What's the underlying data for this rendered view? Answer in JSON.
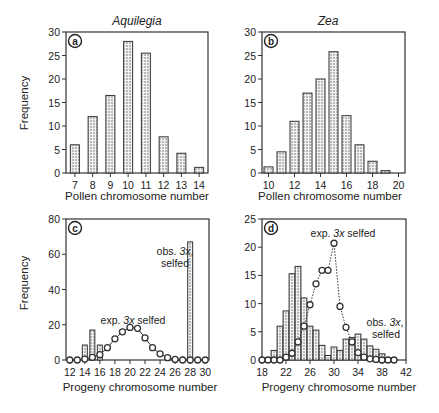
{
  "figure": {
    "ylabel": "Frequency",
    "colors": {
      "axis": "#333333",
      "bar_fill": "#d8d8d8",
      "bar_stroke": "#333333",
      "marker_fill": "#ffffff",
      "line": "#333333"
    }
  },
  "chart_data": [
    {
      "id": "a",
      "type": "bar",
      "title": "Aquilegia",
      "panel_label": "a",
      "xlabel": "Pollen chromosome number",
      "ylabel": "Frequency",
      "categories": [
        7,
        8,
        9,
        10,
        11,
        12,
        13,
        14
      ],
      "values": [
        6,
        12,
        16.5,
        28,
        25.5,
        7.7,
        4.2,
        1.2
      ],
      "xticks": [
        7,
        8,
        9,
        10,
        11,
        12,
        13,
        14
      ],
      "yticks": [
        0,
        5,
        10,
        15,
        20,
        25,
        30
      ],
      "xlim": [
        6.5,
        14.5
      ],
      "ylim": [
        0,
        30
      ],
      "grid": false
    },
    {
      "id": "b",
      "type": "bar",
      "title": "Zea",
      "panel_label": "b",
      "xlabel": "Pollen chromosome number",
      "ylabel": "",
      "categories": [
        10,
        11,
        12,
        13,
        14,
        15,
        16,
        17,
        18,
        19
      ],
      "values": [
        1.3,
        4.5,
        11,
        17,
        20,
        25.8,
        12.2,
        6,
        2.5,
        0.5
      ],
      "xticks": [
        10,
        12,
        14,
        16,
        18,
        20
      ],
      "yticks": [
        0,
        5,
        10,
        15,
        20,
        25,
        30
      ],
      "xlim": [
        9.5,
        20.5
      ],
      "ylim": [
        0,
        30
      ],
      "grid": false
    },
    {
      "id": "c",
      "type": "bar+line",
      "title": "",
      "panel_label": "c",
      "xlabel": "Progeny chromosome number",
      "ylabel": "Frequency",
      "series": [
        {
          "name": "obs. 3x, selfed",
          "type": "bar",
          "x": [
            14,
            15,
            16,
            28
          ],
          "values": [
            8.5,
            17,
            8.5,
            67
          ]
        },
        {
          "name": "exp. 3x selfed",
          "type": "line",
          "x": [
            12,
            13,
            14,
            15,
            16,
            17,
            18,
            19,
            20,
            21,
            22,
            23,
            24,
            25,
            26,
            27,
            28,
            29,
            30
          ],
          "values": [
            0,
            0,
            0.5,
            1.5,
            3,
            7,
            12,
            16,
            18.5,
            18,
            12.5,
            7,
            3.5,
            1.3,
            0.3,
            0,
            0,
            0,
            0
          ]
        }
      ],
      "annotations": [
        {
          "text_line1": "obs. 3x,",
          "text_line2": "selfed"
        },
        {
          "text": "exp. 3x selfed"
        }
      ],
      "xticks": [
        12,
        14,
        16,
        18,
        20,
        22,
        24,
        26,
        28,
        30
      ],
      "yticks": [
        0,
        20,
        40,
        60,
        80
      ],
      "xlim": [
        11.5,
        30.5
      ],
      "ylim": [
        0,
        80
      ],
      "grid": false
    },
    {
      "id": "d",
      "type": "bar+line",
      "title": "",
      "panel_label": "d",
      "xlabel": "Progeny chromosome number",
      "ylabel": "",
      "series": [
        {
          "name": "obs. 3x, selfed",
          "type": "bar",
          "x": [
            19,
            20,
            21,
            22,
            23,
            24,
            25,
            26,
            27,
            28,
            29,
            30,
            31,
            32,
            33,
            34,
            35,
            36,
            37,
            38,
            39
          ],
          "values": [
            0.4,
            1.7,
            6,
            8.7,
            15.3,
            16.6,
            11,
            6,
            5.3,
            2.6,
            0.8,
            2.3,
            1.7,
            3.7,
            4,
            4.6,
            3.7,
            2.5,
            1.9,
            1.1,
            0.3
          ]
        },
        {
          "name": "exp. 3x selfed",
          "type": "line",
          "x": [
            18,
            19,
            20,
            21,
            22,
            23,
            24,
            25,
            26,
            27,
            28,
            29,
            30,
            31,
            32,
            33,
            34,
            35,
            36,
            37,
            38,
            39,
            40
          ],
          "values": [
            0,
            0,
            0,
            0,
            0.5,
            1.2,
            3.2,
            6,
            9.8,
            13.5,
            15.9,
            15.9,
            20.7,
            9.5,
            5.8,
            3.2,
            1.3,
            0.5,
            0.2,
            0.1,
            0,
            0,
            0
          ]
        }
      ],
      "annotations": [
        {
          "text": "exp. 3x selfed"
        },
        {
          "text_line1": "obs. 3x,",
          "text_line2": "selfed"
        }
      ],
      "xticks": [
        18,
        22,
        26,
        30,
        34,
        38,
        42
      ],
      "yticks": [
        0,
        5,
        10,
        15,
        20,
        25
      ],
      "xlim": [
        18,
        42
      ],
      "ylim": [
        0,
        25
      ],
      "grid": false
    }
  ]
}
